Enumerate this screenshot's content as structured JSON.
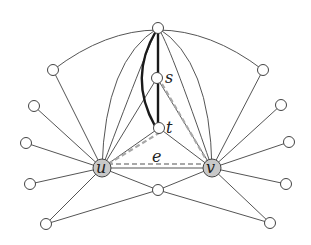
{
  "diagram": {
    "type": "graph",
    "labels": {
      "u": "u",
      "v": "v",
      "s": "s",
      "t": "t",
      "e": "e"
    },
    "nodes": [
      {
        "id": "top",
        "x": 158,
        "y": 28
      },
      {
        "id": "s",
        "x": 157,
        "y": 78
      },
      {
        "id": "t",
        "x": 159,
        "y": 128
      },
      {
        "id": "u",
        "x": 102,
        "y": 168,
        "highlighted": true
      },
      {
        "id": "v",
        "x": 212,
        "y": 168,
        "highlighted": true
      },
      {
        "id": "bottom",
        "x": 158,
        "y": 190
      },
      {
        "id": "l1",
        "x": 53,
        "y": 70
      },
      {
        "id": "l2",
        "x": 34,
        "y": 106
      },
      {
        "id": "l3",
        "x": 26,
        "y": 143
      },
      {
        "id": "l4",
        "x": 30,
        "y": 184
      },
      {
        "id": "l5",
        "x": 46,
        "y": 224
      },
      {
        "id": "r1",
        "x": 263,
        "y": 70
      },
      {
        "id": "r2",
        "x": 281,
        "y": 105
      },
      {
        "id": "r3",
        "x": 289,
        "y": 142
      },
      {
        "id": "r4",
        "x": 286,
        "y": 184
      },
      {
        "id": "r5",
        "x": 270,
        "y": 223
      }
    ],
    "edge_styles": {
      "normal": "thin gray",
      "bold": "thick black (top–s–t path)",
      "dashed": "gray dashed triangle u–s–v via t"
    },
    "colors": {
      "edge": "#555555",
      "bold": "#1a1a1a",
      "dashed": "#a8a8a8",
      "highlight_fill": "#c8c8c8"
    }
  }
}
